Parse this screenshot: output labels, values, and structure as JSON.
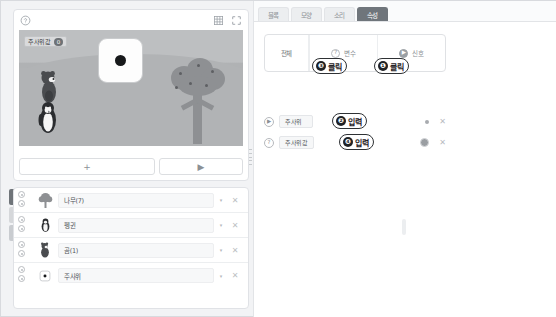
{
  "stage": {
    "help_icon": "question-circle-icon",
    "grid_icon": "grid-icon",
    "fullscreen_icon": "fullscreen-icon",
    "variable_monitor": {
      "name": "주사위값",
      "value": "0"
    },
    "dice_value": "1",
    "add_button_label": "+",
    "play_button_label": "▶"
  },
  "object_list": {
    "rows": [
      {
        "name": "나무(7)",
        "thumb": "tree-thumb",
        "caret": "▾",
        "close": "✕"
      },
      {
        "name": "펭귄",
        "thumb": "penguin-thumb",
        "caret": "▾",
        "close": "✕"
      },
      {
        "name": "곰(1)",
        "thumb": "bear-thumb",
        "caret": "▾",
        "close": "✕"
      },
      {
        "name": "주사위",
        "thumb": "dice-thumb",
        "caret": "▾",
        "close": "✕"
      }
    ]
  },
  "mini_toolbar": {
    "items": [
      {
        "icon": "pointer-icon"
      },
      {
        "icon": "help-icon"
      },
      {
        "icon": "image-icon"
      }
    ]
  },
  "right_panel": {
    "tabs": [
      {
        "label": "블록",
        "active": false
      },
      {
        "label": "모양",
        "active": false
      },
      {
        "label": "소리",
        "active": false
      },
      {
        "label": "속성",
        "active": true
      }
    ],
    "property_header": {
      "all_label": "전체",
      "categories": [
        {
          "label": "변수",
          "badge": "?",
          "badge_filled": false
        },
        {
          "label": "신호",
          "badge": "▶",
          "badge_filled": true
        }
      ]
    },
    "items": [
      {
        "type": "signal",
        "badge": "▶",
        "badge_filled": true,
        "name": "주사위",
        "toggle": "dot",
        "close": "✕"
      },
      {
        "type": "variable",
        "badge": "?",
        "badge_filled": false,
        "name": "주사위값",
        "toggle": "circle",
        "close": "✕"
      }
    ],
    "callouts": [
      {
        "id": "callout-3",
        "num": "❸",
        "text": "클릭"
      },
      {
        "id": "callout-1",
        "num": "❶",
        "text": "클릭"
      },
      {
        "id": "callout-2",
        "num": "❷",
        "text": "입력"
      },
      {
        "id": "callout-4",
        "num": "❹",
        "text": "입력"
      }
    ]
  },
  "colors": {
    "accent": "#6f757b",
    "panel_bg": "#fafbfc",
    "stage_bg": "#b1b3b5",
    "callout_border": "#2e3134"
  }
}
